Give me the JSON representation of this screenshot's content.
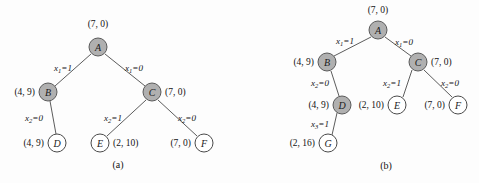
{
  "figure": {
    "background": "#fdfdfd",
    "shaded_node_color": "#b0b0b0",
    "open_node_color": "#ffffff",
    "edge_color": "#4a4a4a",
    "text_color": "#141414"
  },
  "panels": [
    {
      "id": "a",
      "caption": "(a)",
      "caption_pos": {
        "x": 118,
        "y": 164
      },
      "nodes": [
        {
          "id": "A",
          "label": "A",
          "x": 98,
          "y": 47,
          "style": "shaded",
          "value": "(7, 0)",
          "value_pos": {
            "x": 98,
            "y": 24
          },
          "value_anchor": "center"
        },
        {
          "id": "B",
          "label": "B",
          "x": 48,
          "y": 92,
          "style": "shaded",
          "value": "(4, 9)",
          "value_pos": {
            "x": 35,
            "y": 92
          },
          "value_anchor": "right"
        },
        {
          "id": "C",
          "label": "C",
          "x": 152,
          "y": 92,
          "style": "shaded",
          "value": "(7, 0)",
          "value_pos": {
            "x": 165,
            "y": 92
          },
          "value_anchor": "left"
        },
        {
          "id": "D",
          "label": "D",
          "x": 57,
          "y": 143,
          "style": "open",
          "value": "(4, 9)",
          "value_pos": {
            "x": 44,
            "y": 143
          },
          "value_anchor": "right"
        },
        {
          "id": "E",
          "label": "E",
          "x": 100,
          "y": 143,
          "style": "open",
          "value": "(2, 10)",
          "value_pos": {
            "x": 113,
            "y": 143
          },
          "value_anchor": "left"
        },
        {
          "id": "F",
          "label": "F",
          "x": 204,
          "y": 143,
          "style": "open",
          "value": "(7, 0)",
          "value_pos": {
            "x": 191,
            "y": 143
          },
          "value_anchor": "right"
        }
      ],
      "edges": [
        {
          "from": "A",
          "to": "B",
          "x1": 91,
          "y1": 54,
          "x2": 55,
          "y2": 86,
          "var": "x",
          "sub": "1",
          "eq": "=1",
          "label_pos": {
            "x": 63,
            "y": 68
          }
        },
        {
          "from": "A",
          "to": "C",
          "x1": 105,
          "y1": 54,
          "x2": 145,
          "y2": 86,
          "var": "x",
          "sub": "1",
          "eq": "=0",
          "label_pos": {
            "x": 134,
            "y": 68
          }
        },
        {
          "from": "B",
          "to": "D",
          "x1": 50,
          "y1": 101,
          "x2": 56,
          "y2": 134,
          "var": "x",
          "sub": "2",
          "eq": "=0",
          "label_pos": {
            "x": 34,
            "y": 118
          }
        },
        {
          "from": "C",
          "to": "E",
          "x1": 146,
          "y1": 100,
          "x2": 107,
          "y2": 136,
          "var": "x",
          "sub": "2",
          "eq": "=1",
          "label_pos": {
            "x": 113,
            "y": 118
          }
        },
        {
          "from": "C",
          "to": "F",
          "x1": 158,
          "y1": 100,
          "x2": 197,
          "y2": 136,
          "var": "x",
          "sub": "2",
          "eq": "=0",
          "label_pos": {
            "x": 187,
            "y": 118
          }
        }
      ]
    },
    {
      "id": "b",
      "caption": "(b)",
      "caption_pos": {
        "x": 386,
        "y": 165
      },
      "nodes": [
        {
          "id": "A",
          "label": "A",
          "x": 378,
          "y": 30,
          "style": "shaded",
          "value": "(7, 0)",
          "value_pos": {
            "x": 378,
            "y": 10
          },
          "value_anchor": "center"
        },
        {
          "id": "B",
          "label": "B",
          "x": 327,
          "y": 62,
          "style": "shaded",
          "value": "(4, 9)",
          "value_pos": {
            "x": 314,
            "y": 62
          },
          "value_anchor": "right"
        },
        {
          "id": "C",
          "label": "C",
          "x": 418,
          "y": 62,
          "style": "shaded",
          "value": "(7, 0)",
          "value_pos": {
            "x": 431,
            "y": 62
          },
          "value_anchor": "left"
        },
        {
          "id": "D",
          "label": "D",
          "x": 342,
          "y": 105,
          "style": "shaded",
          "value": "(4, 9)",
          "value_pos": {
            "x": 329,
            "y": 105
          },
          "value_anchor": "right"
        },
        {
          "id": "E",
          "label": "E",
          "x": 397,
          "y": 105,
          "style": "open",
          "value": "(2, 10)",
          "value_pos": {
            "x": 384,
            "y": 105
          },
          "value_anchor": "right"
        },
        {
          "id": "F",
          "label": "F",
          "x": 458,
          "y": 105,
          "style": "open",
          "value": "(7, 0)",
          "value_pos": {
            "x": 445,
            "y": 105
          },
          "value_anchor": "right"
        },
        {
          "id": "G",
          "label": "G",
          "x": 328,
          "y": 143,
          "style": "open",
          "value": "(2, 16)",
          "value_pos": {
            "x": 315,
            "y": 143
          },
          "value_anchor": "right"
        }
      ],
      "edges": [
        {
          "from": "A",
          "to": "B",
          "x1": 371,
          "y1": 37,
          "x2": 334,
          "y2": 56,
          "var": "x",
          "sub": "1",
          "eq": "=1",
          "label_pos": {
            "x": 345,
            "y": 41
          }
        },
        {
          "from": "A",
          "to": "C",
          "x1": 385,
          "y1": 37,
          "x2": 411,
          "y2": 56,
          "var": "x",
          "sub": "1",
          "eq": "=0",
          "label_pos": {
            "x": 404,
            "y": 42
          }
        },
        {
          "from": "B",
          "to": "D",
          "x1": 331,
          "y1": 71,
          "x2": 339,
          "y2": 96,
          "var": "x",
          "sub": "2",
          "eq": "=0",
          "label_pos": {
            "x": 320,
            "y": 83
          }
        },
        {
          "from": "C",
          "to": "E",
          "x1": 412,
          "y1": 70,
          "x2": 403,
          "y2": 97,
          "var": "x",
          "sub": "2",
          "eq": "=1",
          "label_pos": {
            "x": 392,
            "y": 83
          }
        },
        {
          "from": "C",
          "to": "F",
          "x1": 424,
          "y1": 70,
          "x2": 452,
          "y2": 97,
          "var": "x",
          "sub": "2",
          "eq": "=0",
          "label_pos": {
            "x": 450,
            "y": 83
          }
        },
        {
          "from": "D",
          "to": "G",
          "x1": 337,
          "y1": 113,
          "x2": 332,
          "y2": 135,
          "var": "x",
          "sub": "3",
          "eq": "=1",
          "label_pos": {
            "x": 320,
            "y": 124
          }
        }
      ]
    }
  ]
}
